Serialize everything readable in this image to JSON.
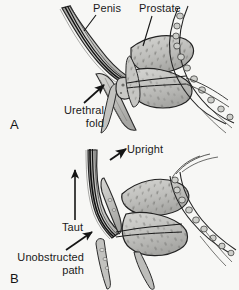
{
  "figure": {
    "kind": "medical-illustration",
    "style": "grayscale pen-and-ink anatomical drawing",
    "width": 239,
    "height": 290,
    "background_color": "#f7f7f5",
    "ink_color": "#1a1a1a",
    "fill_light": "#cfcfcc",
    "fill_mid": "#b0b0ad",
    "fill_dark": "#8d8d8a"
  },
  "panels": [
    {
      "letter": "A",
      "caption_position": "bottom-left",
      "description": "Dependent penis, urethral fold present",
      "labels": [
        {
          "name": "penis",
          "text": "Penis",
          "leader": "line",
          "points_to": "penile shaft"
        },
        {
          "name": "prostate",
          "text": "Prostate",
          "leader": "line",
          "points_to": "prostate gland"
        },
        {
          "name": "urethral-fold",
          "line1": "Urethral",
          "line2": "fold",
          "leader": "arrow",
          "points_to": "urethral bend at penile base"
        }
      ]
    },
    {
      "letter": "B",
      "caption_position": "bottom-left",
      "description": "Penis held upright, urethra taut and path unobstructed",
      "labels": [
        {
          "name": "upright",
          "text": "Upright",
          "leader": "arrow",
          "points_to": "elevated penile shaft"
        },
        {
          "name": "taut",
          "text": "Taut",
          "leader": "vertical-arrow",
          "points_to": "stretched urethra"
        },
        {
          "name": "unobstructed-path",
          "line1": "Unobstructed",
          "line2": "path",
          "leader": "arrow",
          "points_to": "open urethral lumen at base"
        }
      ]
    }
  ]
}
